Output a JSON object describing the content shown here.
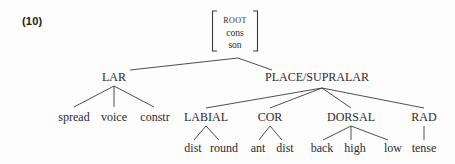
{
  "example": {
    "number_label": "(10)"
  },
  "diagram": {
    "line_color": "#3a3a3a",
    "text_color": "#2b2b2b",
    "background_color": "#fdfdfd"
  },
  "root_matrix": {
    "features": [
      "ROOT",
      "cons",
      "son"
    ],
    "bracket_style": "square"
  },
  "nodes": {
    "lar": "LAR",
    "place": "PLACE/SUPRALAR",
    "labial": "LABIAL",
    "cor": "COR",
    "dorsal": "DORSAL",
    "rad": "RAD"
  },
  "leaves": {
    "lar": [
      "spread",
      "voice",
      "constr"
    ],
    "labial": [
      "dist",
      "round"
    ],
    "cor": [
      "ant",
      "dist"
    ],
    "dorsal": [
      "back",
      "high",
      "low"
    ],
    "rad": [
      "tense"
    ]
  },
  "tree_structure": {
    "root": {
      "label": "ROOT / cons / son",
      "children": [
        {
          "label": "LAR",
          "children": [
            {
              "label": "spread"
            },
            {
              "label": "voice"
            },
            {
              "label": "constr"
            }
          ]
        },
        {
          "label": "PLACE/SUPRALAR",
          "children": [
            {
              "label": "LABIAL",
              "children": [
                {
                  "label": "dist"
                },
                {
                  "label": "round"
                }
              ]
            },
            {
              "label": "COR",
              "children": [
                {
                  "label": "ant"
                },
                {
                  "label": "dist"
                }
              ]
            },
            {
              "label": "DORSAL",
              "children": [
                {
                  "label": "back"
                },
                {
                  "label": "high"
                },
                {
                  "label": "low"
                }
              ]
            },
            {
              "label": "RAD",
              "children": [
                {
                  "label": "tense"
                }
              ]
            }
          ]
        }
      ]
    }
  }
}
